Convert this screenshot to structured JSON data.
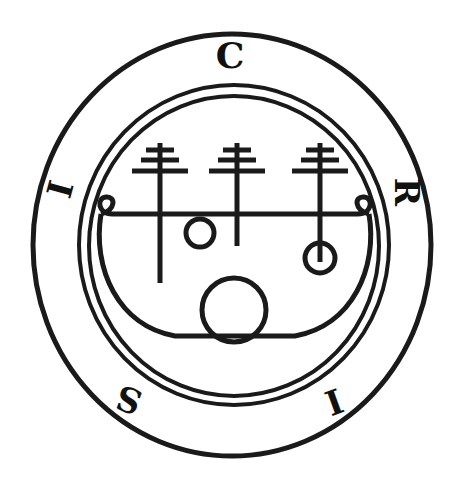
{
  "image": {
    "kind": "occult-sigil",
    "title": "Seal of Sitri",
    "background_color": "#ffffff",
    "ink_color": "#1a1a1a",
    "width": 462,
    "height": 489
  },
  "rings": {
    "outer": {
      "name": "outer-ring",
      "cx": 232,
      "cy": 245,
      "rx": 199,
      "ry": 211,
      "stroke_width": 5
    },
    "inner_outer": {
      "name": "inner-ring-outer",
      "cx": 234,
      "cy": 245,
      "rx": 155,
      "ry": 160,
      "stroke_width": 4
    },
    "inner_inner": {
      "name": "inner-ring-inner",
      "cx": 234,
      "cy": 246,
      "rx": 145,
      "ry": 150,
      "stroke_width": 4
    }
  },
  "ring_letters": [
    {
      "char": "C",
      "display": "C",
      "position": "top",
      "angle_deg": 0,
      "rotation_deg": 0,
      "x": 230,
      "y": 59,
      "style": "blackletter"
    },
    {
      "char": "R",
      "display": "R",
      "position": "right",
      "angle_deg": 90,
      "rotation_deg": 90,
      "x": 404,
      "y": 192,
      "style": "roman"
    },
    {
      "char": "I",
      "display": "I",
      "position": "bottom-right",
      "angle_deg": 140,
      "rotation_deg": 160,
      "x": 333,
      "y": 399,
      "style": "roman"
    },
    {
      "char": "S",
      "display": "S",
      "position": "bottom-left",
      "angle_deg": 220,
      "rotation_deg": 200,
      "x": 130,
      "y": 397,
      "style": "roman"
    },
    {
      "char": "I",
      "display": "I",
      "position": "left",
      "angle_deg": 270,
      "rotation_deg": 285,
      "x": 63,
      "y": 190,
      "style": "roman"
    }
  ],
  "ring_letter_sequence_clockwise": [
    "C",
    "R",
    "I",
    "S",
    "I"
  ],
  "sigil": {
    "name": "sitri-sigil",
    "stroke_width": 5,
    "horizontal_bar": {
      "x1": 108,
      "x2": 362,
      "y": 214
    },
    "left_curl": {
      "cx": 110,
      "cy": 207,
      "r": 9,
      "note": "small loop at left terminal of bar"
    },
    "right_curl": {
      "cx": 359,
      "cy": 207,
      "r": 9,
      "note": "small loop at right terminal of bar"
    },
    "bowl": {
      "left_x": 90,
      "right_x": 378,
      "top_y": 214,
      "bottom_y": 336,
      "note": "wide U-shaped basin descending from bar terminals"
    },
    "staffs": [
      {
        "id": "left-staff",
        "x": 160,
        "top_y": 143,
        "bottom_y": 283,
        "crossbars": 3,
        "terminal": "plain"
      },
      {
        "id": "center-staff",
        "x": 237,
        "top_y": 143,
        "bottom_y": 246,
        "crossbars": 3,
        "terminal": "plain"
      },
      {
        "id": "right-staff",
        "x": 320,
        "top_y": 143,
        "bottom_y": 265,
        "crossbars": 3,
        "terminal": "circle"
      }
    ],
    "crossbar_spec": [
      {
        "index": 0,
        "dy": 7,
        "half_width": 14
      },
      {
        "index": 1,
        "dy": 17,
        "half_width": 19
      },
      {
        "index": 2,
        "dy": 28,
        "half_width": 28
      }
    ],
    "circles": [
      {
        "id": "bar-small-circle",
        "cx": 200,
        "cy": 233,
        "r": 14,
        "stroke_width": 5
      },
      {
        "id": "right-staff-circle",
        "cx": 320,
        "cy": 258,
        "r": 15,
        "stroke_width": 5
      },
      {
        "id": "bottom-large-circle",
        "cx": 234,
        "cy": 310,
        "r": 32,
        "stroke_width": 5
      }
    ]
  }
}
